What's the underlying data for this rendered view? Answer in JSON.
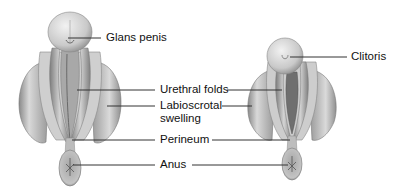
{
  "figure": {
    "male_structure": "male-embryo-genitalia",
    "female_structure": "female-embryo-genitalia"
  },
  "labels": {
    "glans_penis": "Glans penis",
    "clitoris": "Clitoris",
    "urethral_folds": "Urethral folds",
    "labioscrotal_line1": "Labioscrotal",
    "labioscrotal_line2": "swelling",
    "perineum": "Perineum",
    "anus": "Anus"
  },
  "colors": {
    "background": "#ffffff",
    "text": "#111111",
    "leader_line": "#333333",
    "tissue_light": "#e6e6e6",
    "tissue_mid": "#b8b8b8",
    "tissue_dark": "#7a7a7a"
  }
}
